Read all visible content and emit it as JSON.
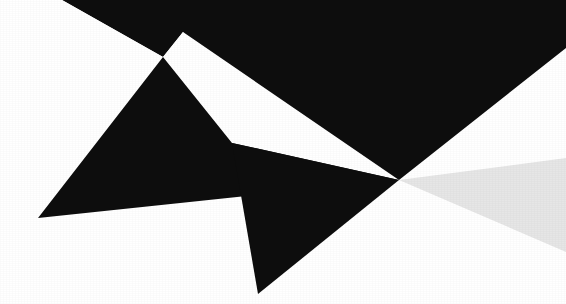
{
  "image": {
    "kind": "abstract-geometric-composition",
    "width": 566,
    "height": 304,
    "background_color": "#ffffff",
    "description": "High-contrast angular black shapes on a white field, converging at a single focal vertex right of center, with a pale gray wedge radiating toward the right edge.",
    "has_text": false,
    "has_ui_chrome": false
  },
  "palette": {
    "black": "#0d0d0d",
    "black_soft": "#131313",
    "white": "#ffffff",
    "gray_wedge": "#e6e6e6",
    "gray_wedge_edge": "#ededed"
  },
  "focal_point": {
    "label": "convergence-vertex",
    "x": 399,
    "y": 180
  },
  "shapes": [
    {
      "name": "upper-black-mass",
      "role": "primary-dark-field",
      "fill": "#0d0d0d",
      "points": "62,0 566,0 566,48 399,180 183,32 163,57"
    },
    {
      "name": "upper-white-triangle",
      "role": "negative-space-wedge",
      "fill": "#ffffff",
      "points": "183,32 163,57 232,143"
    },
    {
      "name": "left-white-field",
      "role": "negative-space-field",
      "fill": "#ffffff",
      "points": "0,0 62,0 163,57 38,218 0,218"
    },
    {
      "name": "lower-left-black-wedge",
      "role": "secondary-dark-wedge",
      "fill": "#0d0d0d",
      "points": "38,218 163,57 232,143 399,180"
    },
    {
      "name": "bottom-black-triangle",
      "role": "tertiary-dark-wedge",
      "fill": "#0d0d0d",
      "points": "399,180 258,294 232,143"
    },
    {
      "name": "right-gray-wedge",
      "role": "pale-accent-wedge",
      "fill": "#e6e6e6",
      "points": "399,180 566,158 566,252"
    },
    {
      "name": "lower-white-field",
      "role": "negative-space-field",
      "fill": "#ffffff",
      "points": "0,218 38,218 258,294 0,304"
    }
  ]
}
